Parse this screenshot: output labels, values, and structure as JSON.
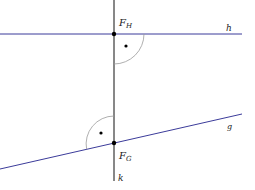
{
  "diagram": {
    "lines": {
      "h": {
        "label": "h",
        "color": "#3b3b9a"
      },
      "g": {
        "label": "g",
        "color": "#3b3b9a"
      },
      "k": {
        "label": "k",
        "color": "#111111"
      }
    },
    "points": {
      "fh": {
        "label": "F",
        "sub": "H"
      },
      "fg": {
        "label": "F",
        "sub": "G"
      }
    },
    "arc_color": "#9a9a9a"
  }
}
